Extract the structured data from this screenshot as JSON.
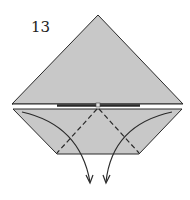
{
  "diagram": {
    "step_number": "13",
    "colors": {
      "paper": "#c8c8c8",
      "stroke": "#2a2a2a",
      "background": "#ffffff"
    },
    "elements": {
      "upper_triangle": "folded triangle flap",
      "lower_trapezoid": "bottom flap with valley-fold lines",
      "valley_fold_lines": 2,
      "fold_arrows": 2
    }
  }
}
